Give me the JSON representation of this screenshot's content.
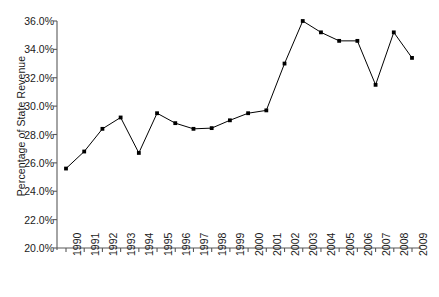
{
  "chart_data": {
    "type": "line",
    "title": "",
    "xlabel": "",
    "ylabel": "Percentage of State Revenue",
    "categories": [
      "1990",
      "1991",
      "1992",
      "1993",
      "1994",
      "1995",
      "1996",
      "1997",
      "1998",
      "1999",
      "2000",
      "2001",
      "2002",
      "2003",
      "2004",
      "2005",
      "2006",
      "2007",
      "2008",
      "2009"
    ],
    "values": [
      25.6,
      26.8,
      28.4,
      29.2,
      26.7,
      29.5,
      28.8,
      28.4,
      28.45,
      29.0,
      29.5,
      29.7,
      33.0,
      36.0,
      35.2,
      34.6,
      34.6,
      31.5,
      35.2,
      33.4
    ],
    "ylim": [
      20.0,
      36.0
    ],
    "yticks": [
      20.0,
      22.0,
      24.0,
      26.0,
      28.0,
      30.0,
      32.0,
      34.0,
      36.0
    ],
    "ytick_labels": [
      "20.0%",
      "22.0%",
      "24.0%",
      "26.0%",
      "28.0%",
      "30.0%",
      "32.0%",
      "34.0%",
      "36.0%"
    ],
    "xtick_labels": [
      "1990",
      "1991",
      "1992",
      "1993",
      "1994",
      "1995",
      "1996",
      "1997",
      "1998",
      "1999",
      "2000",
      "2001",
      "2002",
      "2003",
      "2004",
      "2005",
      "2006",
      "2007",
      "2008",
      "2009"
    ],
    "grid": false,
    "legend": null,
    "series_color": "#000000",
    "marker": "square",
    "axis_color": "#595959"
  }
}
